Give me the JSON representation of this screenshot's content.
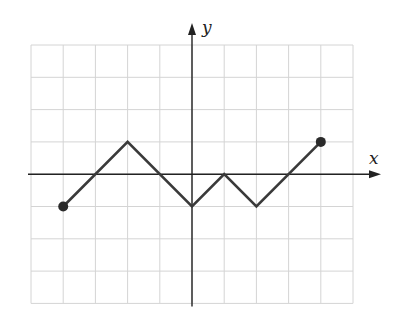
{
  "chart_data": {
    "type": "line",
    "title": "",
    "xlabel": "x",
    "ylabel": "y",
    "xlim": [
      -5,
      5
    ],
    "ylim": [
      -4,
      4
    ],
    "grid": true,
    "legend": null,
    "series": [
      {
        "name": "piecewise-linear graph",
        "points": [
          [
            -4,
            -1
          ],
          [
            -2,
            1
          ],
          [
            0,
            -1
          ],
          [
            1,
            0
          ],
          [
            2,
            -1
          ],
          [
            4,
            1
          ]
        ],
        "endpoints": {
          "start": "closed",
          "end": "closed"
        }
      }
    ]
  },
  "layout": {
    "grid_left": 31,
    "grid_top": 45,
    "cell_w": 32.2,
    "cell_h": 32.3,
    "cols": 10,
    "rows": 8
  },
  "labels": {
    "x_axis": "x",
    "y_axis": "y"
  },
  "colors": {
    "grid": "#d4d4d4",
    "axis": "#222222",
    "curve": "#3a3a3a"
  }
}
